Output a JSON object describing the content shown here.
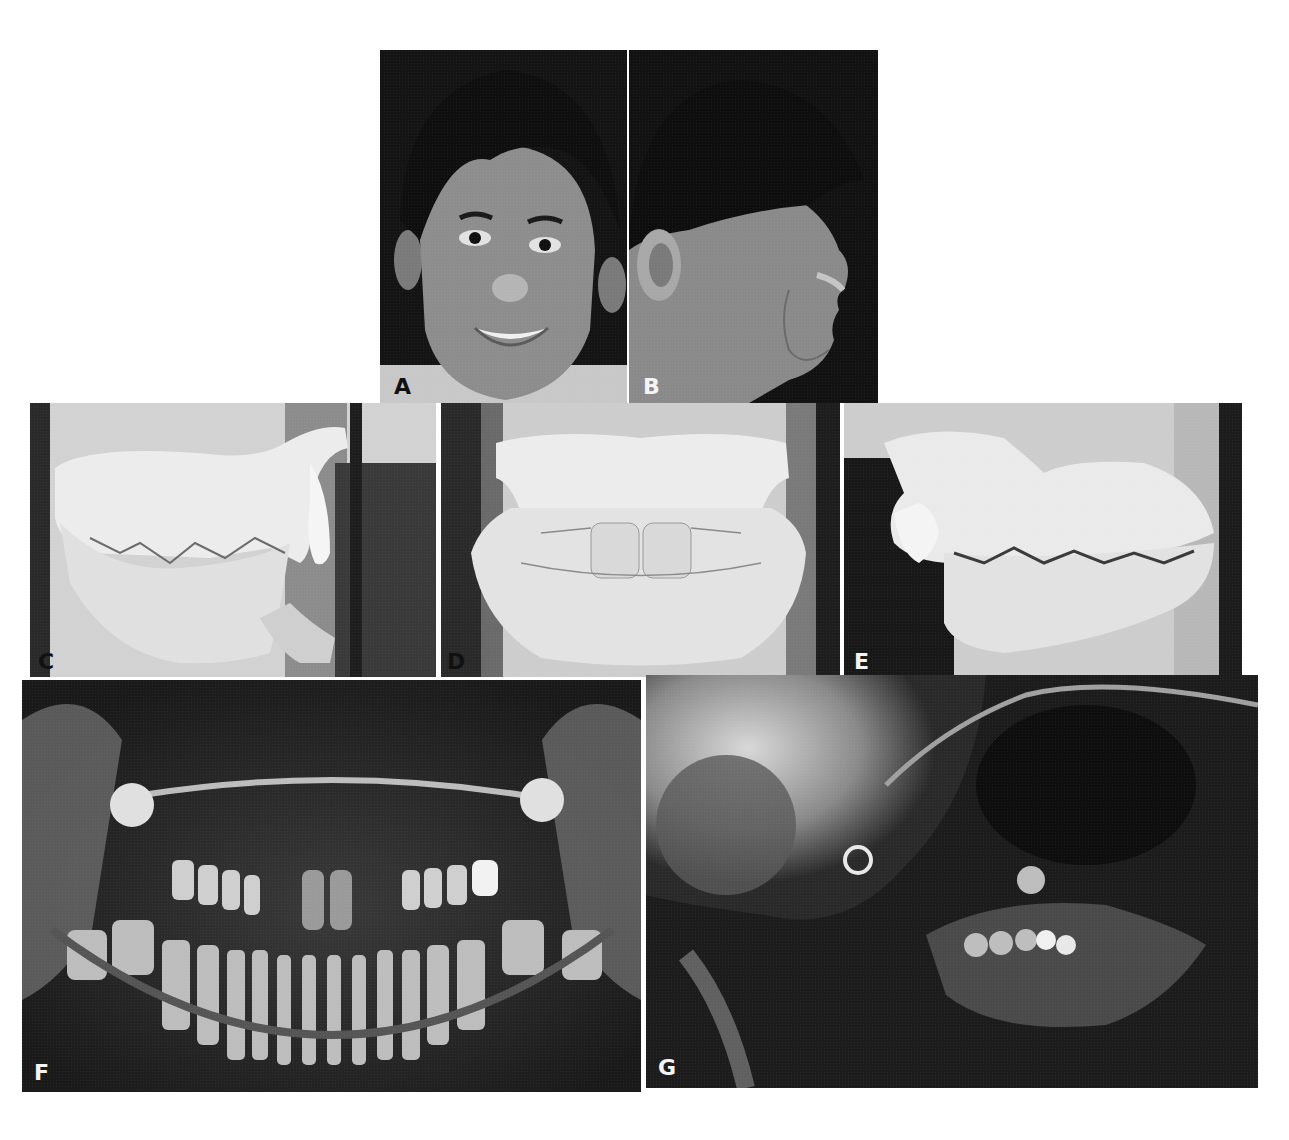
{
  "figure": {
    "panels": [
      {
        "id": "A",
        "label": "A",
        "description": "Frontal facial photograph of smiling adolescent boy",
        "label_color": "dark"
      },
      {
        "id": "B",
        "label": "B",
        "description": "Right profile facial photograph",
        "label_color": "light"
      },
      {
        "id": "C",
        "label": "C",
        "description": "Right lateral view of dental study casts in occlusion",
        "label_color": "light"
      },
      {
        "id": "D",
        "label": "D",
        "description": "Frontal view of dental study casts in occlusion",
        "label_color": "light"
      },
      {
        "id": "E",
        "label": "E",
        "description": "Left lateral view of dental study casts in occlusion",
        "label_color": "light"
      },
      {
        "id": "F",
        "label": "F",
        "description": "Panoramic radiograph of mixed dentition",
        "label_color": "light"
      },
      {
        "id": "G",
        "label": "G",
        "description": "Lateral cephalometric radiograph",
        "label_color": "light"
      }
    ]
  },
  "colors": {
    "background": "#ffffff",
    "photo_dark": "#141414",
    "cast_light": "#e6e6e6",
    "xray_dark": "#1e1e1e"
  }
}
